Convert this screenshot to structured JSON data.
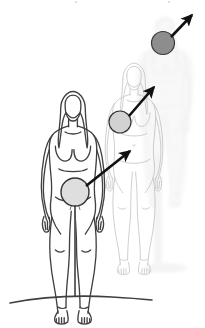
{
  "figure": {
    "title": "Three-stage upward progression of a focal region through the human body",
    "description": "Anatomical line drawing of a standing female figure repeated three times with decreasing line darkness from left to right. A shaded circular marker sits at the pelvis of the front figure, the chest of the middle figure, and the head of the rear figure. Black arrows connect each marker diagonally upward and to the right.",
    "background_color": "#ffffff",
    "canvas": {
      "width": 205,
      "height": 328
    }
  },
  "palette": {
    "ink_front": "#3a3a3a",
    "ink_middle": "#b9b9b9",
    "ink_back": "#e2e2e2",
    "ghost_fill": "#efefef",
    "arrow": "#111111",
    "marker_light_fill": "#dedede",
    "marker_mid_fill": "#d2d2d2",
    "marker_dark_fill": "#8d8d8d",
    "marker_stroke": "#333333",
    "ground_line": "#3f3f3f"
  },
  "figures": [
    {
      "id": "figure-front",
      "label": "Front figure (stage 1)",
      "stage": 1,
      "emphasis": "dark-outline",
      "opacity": 1,
      "marker_region": "pelvis"
    },
    {
      "id": "figure-middle",
      "label": "Middle figure (stage 2)",
      "stage": 2,
      "emphasis": "light-outline",
      "opacity": 0.55,
      "marker_region": "chest"
    },
    {
      "id": "figure-back",
      "label": "Rear figure (stage 3)",
      "stage": 3,
      "emphasis": "ghost-silhouette",
      "opacity": 0.3,
      "marker_region": "head"
    }
  ],
  "markers": [
    {
      "id": "marker-pelvis",
      "label": "Pelvis marker",
      "stage": 1,
      "cx": 75,
      "cy": 192,
      "r": 14,
      "fill": "#dedede",
      "stroke": "#333333",
      "stroke_width": 1.4
    },
    {
      "id": "marker-chest",
      "label": "Chest marker",
      "stage": 2,
      "cx": 120,
      "cy": 122,
      "r": 11,
      "fill": "#d2d2d2",
      "stroke": "#333333",
      "stroke_width": 1.2
    },
    {
      "id": "marker-head",
      "label": "Head marker",
      "stage": 3,
      "cx": 163,
      "cy": 43,
      "r": 11.5,
      "fill": "#8d8d8d",
      "stroke": "#3a3a3a",
      "stroke_width": 1.2
    }
  ],
  "arrows": [
    {
      "id": "arrow-pelvis-to-chest",
      "label": "Arrow from pelvis marker to chest marker",
      "from": {
        "x": 86,
        "y": 186
      },
      "to": {
        "x": 130,
        "y": 151
      },
      "direction": "up-right",
      "color": "#111111",
      "width": 2.6
    },
    {
      "id": "arrow-chest-to-head",
      "label": "Arrow from chest marker to head marker",
      "from": {
        "x": 129,
        "y": 116
      },
      "to": {
        "x": 154,
        "y": 87
      },
      "direction": "up-right",
      "color": "#111111",
      "width": 2.6
    },
    {
      "id": "arrow-head-outward",
      "label": "Arrow from head marker outward beyond the body",
      "from": {
        "x": 171,
        "y": 37
      },
      "to": {
        "x": 192,
        "y": 15
      },
      "direction": "up-right",
      "color": "#111111",
      "width": 2.6
    }
  ],
  "ground": {
    "id": "ground-line",
    "label": "Ground line",
    "color": "#3f3f3f",
    "width": 1.6
  }
}
